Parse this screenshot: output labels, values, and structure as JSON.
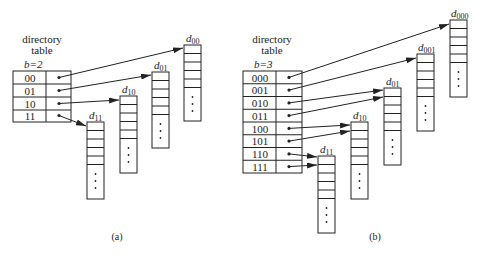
{
  "diagrams": [
    {
      "id": "a",
      "caption": "(a)",
      "title_line1": "directory",
      "title_line2": "table",
      "depth_label": "b=2",
      "rows": [
        "00",
        "01",
        "10",
        "11"
      ],
      "buckets": [
        {
          "label": "d",
          "sub": "00",
          "from_rows": [
            "00"
          ]
        },
        {
          "label": "d",
          "sub": "01",
          "from_rows": [
            "01"
          ]
        },
        {
          "label": "d",
          "sub": "10",
          "from_rows": [
            "10"
          ]
        },
        {
          "label": "d",
          "sub": "11",
          "from_rows": [
            "11"
          ]
        }
      ]
    },
    {
      "id": "b",
      "caption": "(b)",
      "title_line1": "directory",
      "title_line2": "table",
      "depth_label": "b=3",
      "rows": [
        "000",
        "001",
        "010",
        "011",
        "100",
        "101",
        "110",
        "111"
      ],
      "buckets": [
        {
          "label": "d",
          "sub": "000",
          "from_rows": [
            "000"
          ]
        },
        {
          "label": "d",
          "sub": "001",
          "from_rows": [
            "001"
          ]
        },
        {
          "label": "d",
          "sub": "01",
          "from_rows": [
            "010",
            "011"
          ]
        },
        {
          "label": "d",
          "sub": "10",
          "from_rows": [
            "100",
            "101"
          ]
        },
        {
          "label": "d",
          "sub": "11",
          "from_rows": [
            "110",
            "111"
          ]
        }
      ]
    }
  ],
  "colors": {
    "line": "#222222",
    "background": "#ffffff"
  }
}
